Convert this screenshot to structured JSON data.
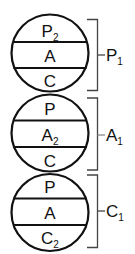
{
  "diagram": {
    "type": "ego-state structural diagram",
    "stroke_color": "#111111",
    "background": "#ffffff",
    "circles": [
      {
        "id": "parent",
        "segments": [
          {
            "main": "P",
            "sub": "2"
          },
          {
            "main": "A",
            "sub": ""
          },
          {
            "main": "C",
            "sub": ""
          }
        ],
        "bracket_label": {
          "main": "P",
          "sub": "1"
        }
      },
      {
        "id": "adult",
        "segments": [
          {
            "main": "P",
            "sub": ""
          },
          {
            "main": "A",
            "sub": "2"
          },
          {
            "main": "C",
            "sub": ""
          }
        ],
        "bracket_label": {
          "main": "A",
          "sub": "1"
        }
      },
      {
        "id": "child",
        "segments": [
          {
            "main": "P",
            "sub": ""
          },
          {
            "main": "A",
            "sub": ""
          },
          {
            "main": "C",
            "sub": "2"
          }
        ],
        "bracket_label": {
          "main": "C",
          "sub": "1"
        }
      }
    ]
  }
}
